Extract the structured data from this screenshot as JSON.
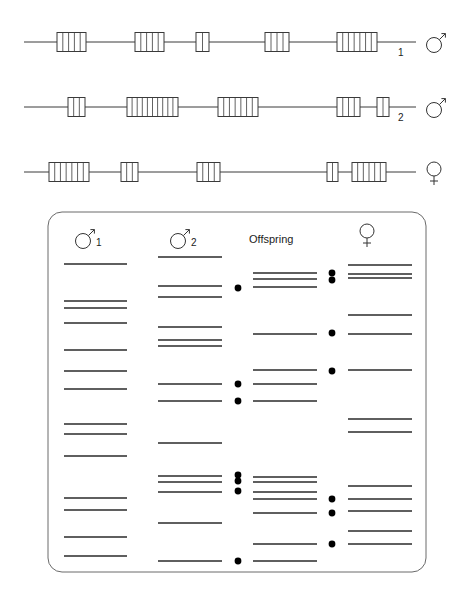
{
  "figure": {
    "type": "dna-fingerprint-diagram",
    "colors": {
      "line": "#3a3a3a",
      "band": "#2a2a2a",
      "dot": "#000000",
      "panel_border": "#6a6a6a"
    }
  },
  "chromosomes": [
    {
      "id": "male-1",
      "symbol": "male",
      "label": "1",
      "y": 42,
      "line_x": [
        24,
        416
      ],
      "repeats": [
        {
          "x": 57,
          "w": 29,
          "units": 5
        },
        {
          "x": 135,
          "w": 29,
          "units": 5
        },
        {
          "x": 196,
          "w": 13,
          "units": 2
        },
        {
          "x": 265,
          "w": 24,
          "units": 4
        },
        {
          "x": 337,
          "w": 40,
          "units": 7
        }
      ],
      "label_pos": [
        398,
        56
      ]
    },
    {
      "id": "male-2",
      "symbol": "male",
      "label": "2",
      "y": 107,
      "line_x": [
        24,
        416
      ],
      "repeats": [
        {
          "x": 68,
          "w": 17,
          "units": 3
        },
        {
          "x": 127,
          "w": 51,
          "units": 10
        },
        {
          "x": 218,
          "w": 40,
          "units": 7
        },
        {
          "x": 337,
          "w": 23,
          "units": 4
        },
        {
          "x": 377,
          "w": 12,
          "units": 2
        }
      ],
      "label_pos": [
        398,
        121
      ]
    },
    {
      "id": "female",
      "symbol": "female",
      "label": "",
      "y": 172,
      "line_x": [
        24,
        416
      ],
      "repeats": [
        {
          "x": 49,
          "w": 40,
          "units": 7
        },
        {
          "x": 121,
          "w": 17,
          "units": 3
        },
        {
          "x": 197,
          "w": 23,
          "units": 4
        },
        {
          "x": 327,
          "w": 11,
          "units": 2
        },
        {
          "x": 352,
          "w": 34,
          "units": 6
        }
      ],
      "label_pos": [
        0,
        0
      ]
    }
  ],
  "gel": {
    "panel": {
      "x": 48,
      "y": 212,
      "w": 378,
      "h": 360,
      "r": 14
    },
    "headers": [
      {
        "id": "male-1",
        "symbol": "male",
        "label": "1",
        "x": 83
      },
      {
        "id": "male-2",
        "symbol": "male",
        "label": "2",
        "x": 178
      },
      {
        "id": "offspring",
        "symbol": "text",
        "label": "Offspring",
        "x": 249
      },
      {
        "id": "female",
        "symbol": "female",
        "label": "",
        "x": 367
      }
    ],
    "lanes": [
      {
        "id": "male-1",
        "x1": 64,
        "x2": 127,
        "bands": [
          264,
          301,
          308,
          323,
          350,
          371,
          389,
          424,
          434,
          456,
          498,
          510,
          537,
          556
        ]
      },
      {
        "id": "male-2",
        "x1": 158,
        "x2": 222,
        "bands": [
          257,
          286,
          297,
          327,
          340,
          346,
          384,
          401,
          443,
          476,
          482,
          492,
          523,
          561
        ]
      },
      {
        "id": "offspring",
        "x1": 253,
        "x2": 317,
        "bands": [
          273,
          279,
          287,
          334,
          370,
          384,
          401,
          477,
          482,
          492,
          499,
          513,
          544,
          561
        ]
      },
      {
        "id": "female",
        "x1": 348,
        "x2": 412,
        "bands": [
          265,
          274,
          278,
          315,
          334,
          370,
          419,
          432,
          486,
          499,
          511,
          531,
          544
        ]
      }
    ],
    "dots": [
      {
        "x": 238,
        "y": 288,
        "side": "paternal"
      },
      {
        "x": 238,
        "y": 384,
        "side": "paternal"
      },
      {
        "x": 238,
        "y": 401,
        "side": "paternal"
      },
      {
        "x": 238,
        "y": 475,
        "side": "paternal"
      },
      {
        "x": 238,
        "y": 481,
        "side": "paternal"
      },
      {
        "x": 238,
        "y": 491,
        "side": "paternal"
      },
      {
        "x": 238,
        "y": 561,
        "side": "paternal"
      },
      {
        "x": 332,
        "y": 273,
        "side": "maternal"
      },
      {
        "x": 332,
        "y": 280,
        "side": "maternal"
      },
      {
        "x": 332,
        "y": 333,
        "side": "maternal"
      },
      {
        "x": 332,
        "y": 371,
        "side": "maternal"
      },
      {
        "x": 332,
        "y": 499,
        "side": "maternal"
      },
      {
        "x": 332,
        "y": 513,
        "side": "maternal"
      },
      {
        "x": 332,
        "y": 544,
        "side": "maternal"
      }
    ]
  }
}
